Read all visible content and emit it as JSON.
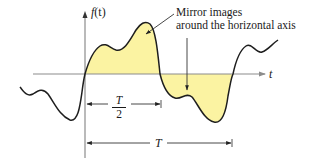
{
  "figure": {
    "y_axis_label_func": "f",
    "y_axis_label_arg": "(t)",
    "x_axis_label": "t",
    "annotation_line1": "Mirror images",
    "annotation_line2": "around the horizontal axis",
    "half_period_numerator": "T",
    "half_period_denominator": "2",
    "period_label": "T",
    "colors": {
      "fill": "#fbf3a2",
      "curve": "#1e1e1e",
      "axis": "#8c8c8c",
      "arrow": "#333333"
    }
  }
}
